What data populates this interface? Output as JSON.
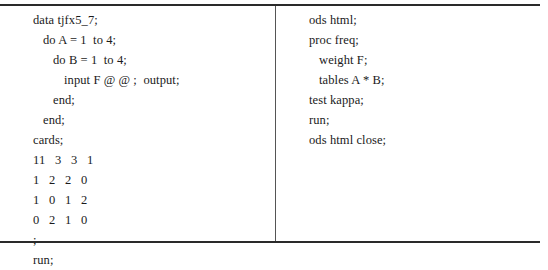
{
  "table": {
    "left_column": {
      "lines": [
        {
          "text": "data tjfx5_7;",
          "indent": 33
        },
        {
          "text": "do A = 1  to 4;",
          "indent": 43
        },
        {
          "text": "do B = 1  to 4;",
          "indent": 53
        },
        {
          "text": "input F @ @ ;  output;",
          "indent": 64
        },
        {
          "text": "end;",
          "indent": 53
        },
        {
          "text": "end;",
          "indent": 43
        },
        {
          "text": "cards;",
          "indent": 33
        },
        {
          "text": "11   3   3   1",
          "indent": 33
        },
        {
          "text": "1   2   2   0",
          "indent": 33
        },
        {
          "text": "1   0   1   2",
          "indent": 33
        },
        {
          "text": "0   2   1   0",
          "indent": 33
        },
        {
          "text": ";",
          "indent": 33
        },
        {
          "text": "run;",
          "indent": 33
        }
      ]
    },
    "right_column": {
      "lines": [
        {
          "text": "ods html;",
          "indent": 33
        },
        {
          "text": "proc freq;",
          "indent": 33
        },
        {
          "text": "weight F;",
          "indent": 43
        },
        {
          "text": "tables A * B;",
          "indent": 43
        },
        {
          "text": "test kappa;",
          "indent": 33
        },
        {
          "text": "run;",
          "indent": 33
        },
        {
          "text": "ods html close;",
          "indent": 33
        }
      ]
    }
  }
}
